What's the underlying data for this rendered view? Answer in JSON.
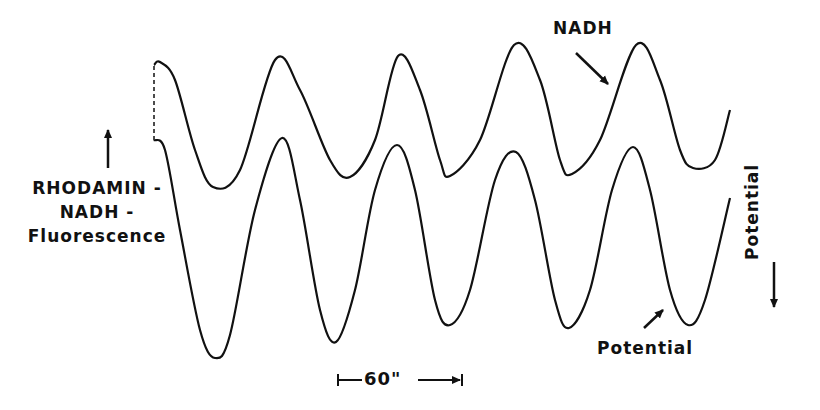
{
  "chart_data": {
    "type": "line",
    "title": "",
    "xlabel": "",
    "ylabel_left": [
      "RHODAMIN-",
      "NADH-",
      "Fluorescence"
    ],
    "ylabel_right": "Potential",
    "grid": false,
    "legend": "none (direct annotations with arrows)",
    "time_scale_bar": {
      "label": "60\"",
      "seconds": 60,
      "x_start_px": 338,
      "x_end_px": 462
    },
    "period_seconds_approx": 60,
    "series": [
      {
        "name": "NADH",
        "description": "Rhodamin-NADH fluorescence trace (upper), oscillating",
        "peaks_t_seconds": [
          0,
          59,
          117,
          174,
          233
        ],
        "troughs_t_seconds": [
          28,
          95,
          143,
          201,
          259
        ],
        "relative_amplitude": "≈ 0.55 of potential trace",
        "points_px": [
          [
            154,
            65
          ],
          [
            160,
            62
          ],
          [
            175,
            80
          ],
          [
            195,
            150
          ],
          [
            213,
            187
          ],
          [
            240,
            170
          ],
          [
            275,
            60
          ],
          [
            300,
            90
          ],
          [
            330,
            160
          ],
          [
            350,
            177
          ],
          [
            375,
            140
          ],
          [
            398,
            56
          ],
          [
            420,
            90
          ],
          [
            440,
            160
          ],
          [
            450,
            176
          ],
          [
            480,
            140
          ],
          [
            514,
            45
          ],
          [
            540,
            80
          ],
          [
            560,
            160
          ],
          [
            572,
            174
          ],
          [
            600,
            140
          ],
          [
            636,
            45
          ],
          [
            660,
            80
          ],
          [
            680,
            150
          ],
          [
            693,
            168
          ],
          [
            715,
            160
          ],
          [
            730,
            110
          ]
        ]
      },
      {
        "name": "Potential",
        "description": "Membrane potential trace (lower), oscillating in phase with NADH",
        "peaks_t_seconds": [
          60,
          117,
          176,
          231
        ],
        "troughs_t_seconds": [
          29,
          88,
          143,
          200,
          256
        ],
        "relative_amplitude": "≈ 1.0",
        "points_px": [
          [
            154,
            140
          ],
          [
            165,
            150
          ],
          [
            180,
            230
          ],
          [
            200,
            330
          ],
          [
            215,
            358
          ],
          [
            230,
            335
          ],
          [
            255,
            210
          ],
          [
            282,
            138
          ],
          [
            300,
            200
          ],
          [
            320,
            310
          ],
          [
            336,
            342
          ],
          [
            355,
            290
          ],
          [
            375,
            190
          ],
          [
            397,
            145
          ],
          [
            415,
            190
          ],
          [
            435,
            300
          ],
          [
            450,
            325
          ],
          [
            470,
            290
          ],
          [
            495,
            180
          ],
          [
            516,
            152
          ],
          [
            535,
            200
          ],
          [
            555,
            300
          ],
          [
            569,
            328
          ],
          [
            590,
            290
          ],
          [
            612,
            190
          ],
          [
            633,
            147
          ],
          [
            650,
            190
          ],
          [
            670,
            290
          ],
          [
            688,
            325
          ],
          [
            705,
            300
          ],
          [
            730,
            198
          ]
        ]
      }
    ],
    "annotations": [
      {
        "text": "NADH",
        "arrow_to": "upper trace near x=610,y=85"
      },
      {
        "text": "Potential",
        "arrow_to": "lower trace near x=665,y=308"
      }
    ]
  },
  "labels": {
    "left_axis": [
      "RHODAMIN -",
      "NADH -",
      "Fluorescence"
    ],
    "right_axis": "Potential",
    "nadh": "NADH",
    "potential": "Potential",
    "scale": "60\""
  },
  "colors": {
    "ink": "#111111",
    "background": "#ffffff"
  }
}
